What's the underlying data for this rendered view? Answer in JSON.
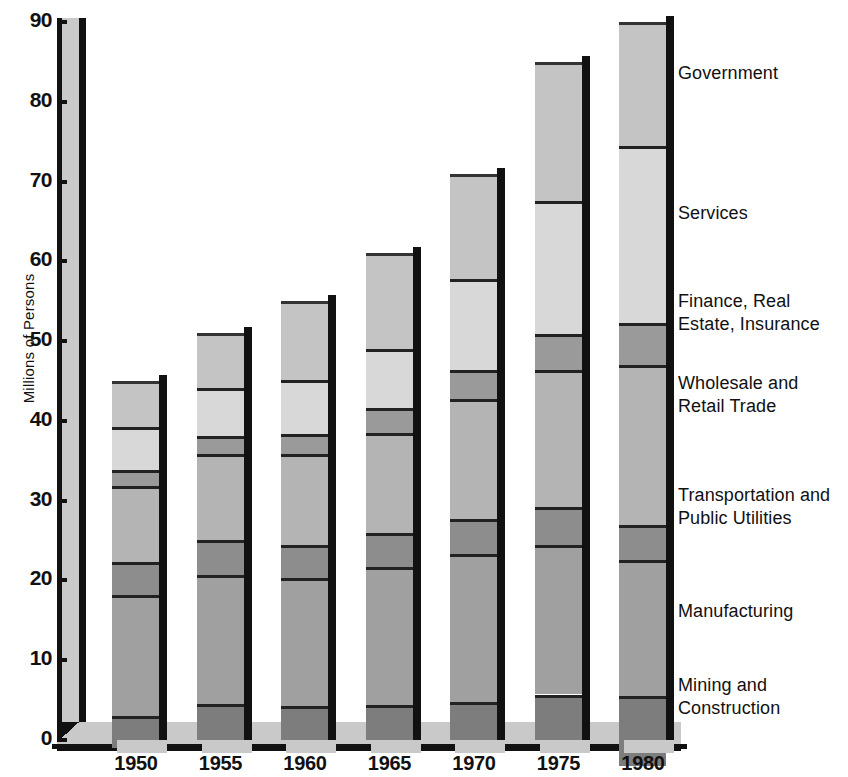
{
  "chart_data": {
    "type": "bar",
    "stacked": true,
    "title": "",
    "xlabel": "",
    "ylabel": "Millions of Persons",
    "ylim": [
      0,
      90
    ],
    "yticks": [
      0,
      10,
      20,
      30,
      40,
      50,
      60,
      70,
      80,
      90
    ],
    "ytick_labels": [
      "0",
      "10",
      "20",
      "30",
      "40",
      "50",
      "60",
      "70",
      "80",
      "90"
    ],
    "grid": false,
    "legend_position": "right-inline",
    "categories": [
      "1950",
      "1955",
      "1960",
      "1965",
      "1970",
      "1975",
      "1980"
    ],
    "series": [
      {
        "name": "Mining and Construction",
        "values": [
          4.0,
          4.5,
          4.3,
          4.4,
          4.7,
          5.7,
          8.8
        ]
      },
      {
        "name": "Manufacturing",
        "values": [
          15.2,
          16.2,
          16.0,
          17.3,
          18.6,
          18.8,
          17.1
        ]
      },
      {
        "name": "Transportation and Public Utilities",
        "values": [
          4.1,
          4.4,
          4.1,
          4.2,
          4.4,
          4.7,
          4.3
        ]
      },
      {
        "name": "Wholesale and Retail Trade",
        "values": [
          9.6,
          10.8,
          11.4,
          12.6,
          15.0,
          17.2,
          20.1
        ]
      },
      {
        "name": "Finance, Real Estate, Insurance",
        "values": [
          1.9,
          2.2,
          2.6,
          3.1,
          3.7,
          4.5,
          5.3
        ]
      },
      {
        "name": "Services",
        "values": [
          5.4,
          6.0,
          6.7,
          7.4,
          11.4,
          16.6,
          22.2
        ]
      },
      {
        "name": "Government",
        "values": [
          5.8,
          6.9,
          9.9,
          12.0,
          13.2,
          17.5,
          15.5
        ]
      }
    ],
    "totals": [
      45,
      51,
      55,
      61,
      71,
      85,
      90
    ],
    "segment_colors": [
      "#7d7d7d",
      "#a0a0a0",
      "#8d8d8d",
      "#b4b4b4",
      "#9a9a9a",
      "#d8d8d8",
      "#c4c4c4"
    ],
    "legend_labels": [
      "Government",
      "Services",
      "Finance, Real\nEstate, Insurance",
      "Wholesale and\nRetail Trade",
      "Transportation and\nPublic Utilities",
      "Manufacturing",
      "Mining and\nConstruction"
    ]
  },
  "axis": {
    "y_title": "Millions of Persons"
  }
}
